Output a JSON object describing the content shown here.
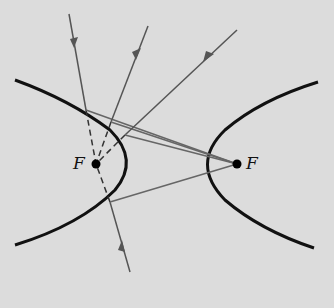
{
  "diagram": {
    "type": "hyperbola-reflection",
    "colors": {
      "background": "#dcdcdc",
      "curve": "#111111",
      "ray": "#555555",
      "focus": "#000000"
    },
    "foci": [
      {
        "label": "F",
        "x": 96,
        "y": 164
      },
      {
        "label": "F",
        "x": 237,
        "y": 164
      }
    ],
    "labels": {
      "left_focus": "F",
      "right_focus": "F"
    }
  }
}
